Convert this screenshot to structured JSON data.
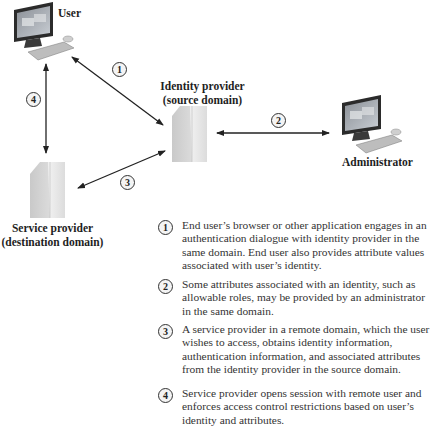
{
  "nodes": {
    "user": {
      "label": "User"
    },
    "identity_provider": {
      "label_line1": "Identity provider",
      "label_line2": "(source domain)"
    },
    "administrator": {
      "label": "Administrator"
    },
    "service_provider": {
      "label_line1": "Service provider",
      "label_line2": "(destination domain)"
    }
  },
  "arrows": [
    {
      "id": "1",
      "label": "1",
      "from": "user",
      "to": "identity_provider"
    },
    {
      "id": "2",
      "label": "2",
      "from": "identity_provider",
      "to": "administrator"
    },
    {
      "id": "3",
      "label": "3",
      "from": "identity_provider",
      "to": "service_provider"
    },
    {
      "id": "4",
      "label": "4",
      "from": "user",
      "to": "service_provider"
    }
  ],
  "legend": [
    {
      "num": "1",
      "text": "End user’s browser or other application engages in an authentication dialogue with identity provider in the same domain. End user also provides attribute values associated with user’s identity."
    },
    {
      "num": "2",
      "text": "Some attributes associated with an identity, such as allowable roles, may be provided by an administrator in the same domain."
    },
    {
      "num": "3",
      "text": "A service provider in a remote domain, which the user wishes to access, obtains identity information, authentication information, and associated attributes from the identity provider in the source domain."
    },
    {
      "num": "4",
      "text": "Service provider opens session with remote user and enforces access control restrictions based on user’s identity and attributes."
    }
  ]
}
